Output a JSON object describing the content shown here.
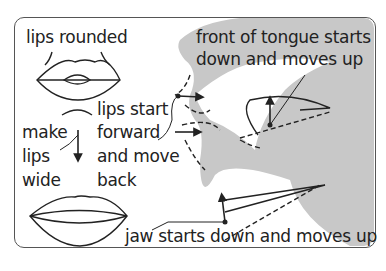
{
  "diagram": {
    "type": "articulation diagram",
    "labels": {
      "lips_rounded": "lips rounded",
      "lips_start_1": "lips start",
      "lips_start_2": "forward",
      "lips_start_3": "and move",
      "lips_start_4": "back",
      "make_1": "make",
      "make_2": "lips",
      "make_3": "wide",
      "tongue_1": "front of tongue starts",
      "tongue_2": "down and moves up",
      "jaw": "jaw starts down and moves up"
    },
    "colors": {
      "face": "#c8c8c8",
      "line": "#222222",
      "border": "#555555",
      "background": "#ffffff"
    }
  }
}
